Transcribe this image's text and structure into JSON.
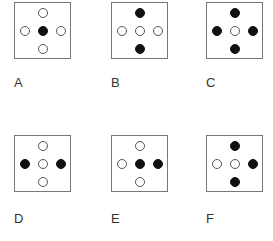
{
  "options": [
    {
      "label": "A",
      "dots": {
        "top": "empty",
        "left": "empty",
        "center": "filled",
        "right": "empty",
        "bottom": "empty"
      }
    },
    {
      "label": "B",
      "dots": {
        "top": "filled",
        "left": "empty",
        "center": "empty",
        "right": "empty",
        "bottom": "filled"
      }
    },
    {
      "label": "C",
      "dots": {
        "top": "filled",
        "left": "filled",
        "center": "empty",
        "right": "filled",
        "bottom": "filled"
      }
    },
    {
      "label": "D",
      "dots": {
        "top": "empty",
        "left": "filled",
        "center": "empty",
        "right": "filled",
        "bottom": "empty"
      }
    },
    {
      "label": "E",
      "dots": {
        "top": "empty",
        "left": "empty",
        "center": "filled",
        "right": "filled",
        "bottom": "empty"
      }
    },
    {
      "label": "F",
      "dots": {
        "top": "filled",
        "left": "empty",
        "center": "empty",
        "right": "filled",
        "bottom": "filled"
      }
    }
  ],
  "colors": {
    "filled": "#111111",
    "empty_stroke": "#555555",
    "box_border": "#777777"
  }
}
